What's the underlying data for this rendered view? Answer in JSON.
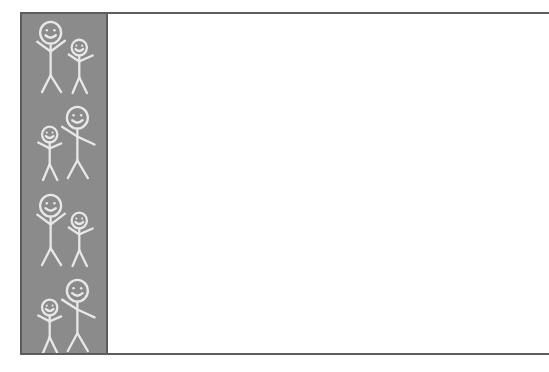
{
  "document": {
    "title": "",
    "background_color": "#ffffff",
    "width": 549,
    "height": 372
  },
  "rules": {
    "top_rule_label": "top-horizontal-rule",
    "bottom_rule_label": "bottom-horizontal-rule",
    "color": "#5d5d5d"
  },
  "sidebar": {
    "label": "decorative-people-sidebar",
    "background_color": "#8b8b8b",
    "border_color": "#5d5d5d",
    "stroke_color": "#e8e8e8",
    "motif": "stick-figure-people-smiling",
    "figure_groups": [
      {
        "order": 1,
        "layout": "large-left-small-right",
        "figures": [
          "large-stick-figure",
          "small-stick-figure"
        ]
      },
      {
        "order": 2,
        "layout": "small-left-large-right",
        "figures": [
          "small-stick-figure",
          "large-stick-figure"
        ]
      },
      {
        "order": 3,
        "layout": "large-left-small-right",
        "figures": [
          "large-stick-figure",
          "small-stick-figure"
        ]
      },
      {
        "order": 4,
        "layout": "small-left-large-right",
        "figures": [
          "small-stick-figure",
          "large-stick-figure"
        ]
      }
    ],
    "figure_count": 8
  },
  "content": {
    "label": "document-body",
    "text": "",
    "placeholder": ""
  }
}
